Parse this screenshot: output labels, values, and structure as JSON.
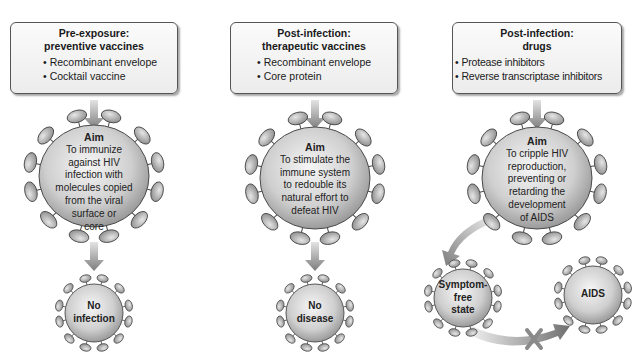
{
  "columns": [
    {
      "id": "preventive",
      "box": {
        "title_line1": "Pre-exposure:",
        "title_line2": "preventive vaccines",
        "items": [
          "Recombinant envelope",
          "Cocktail vaccine"
        ]
      },
      "aim": {
        "label": "Aim",
        "lines": [
          "To immunize",
          "against HIV",
          "infection with",
          "molecules copied",
          "from the viral",
          "surface or",
          "core"
        ]
      },
      "outcome": {
        "lines": [
          "No",
          "infection"
        ]
      }
    },
    {
      "id": "therapeutic",
      "box": {
        "title_line1": "Post-infection:",
        "title_line2": "therapeutic vaccines",
        "items": [
          "Recombinant envelope",
          "Core protein"
        ]
      },
      "aim": {
        "label": "Aim",
        "lines": [
          "To stimulate the",
          "immune system",
          "to redouble its",
          "natural effort to",
          "defeat HIV"
        ]
      },
      "outcome": {
        "lines": [
          "No",
          "disease"
        ]
      }
    },
    {
      "id": "drugs",
      "box": {
        "title_line1": "Post-infection:",
        "title_line2": "drugs",
        "items": [
          "Protease inhibitors",
          "Reverse transcriptase inhibitors"
        ]
      },
      "aim": {
        "label": "Aim",
        "lines": [
          "To cripple HIV",
          "reproduction,",
          "preventing or",
          "retarding the",
          "development",
          "of AIDS"
        ]
      },
      "outcomes": [
        {
          "lines": [
            "Symptom-",
            "free",
            "state"
          ]
        },
        {
          "lines": [
            "AIDS"
          ]
        }
      ],
      "blocked_transition": {
        "from": "Symptom-free state",
        "to": "AIDS",
        "marker": "cross-icon"
      }
    }
  ],
  "colors": {
    "virus_fill_light": "#f2f2f2",
    "virus_fill_dark": "#9a9a9a",
    "spike_fill": "#b5b5b5",
    "outline": "#4a4a4a",
    "arrow": "#8a8a8a",
    "box_border": "#555555"
  }
}
